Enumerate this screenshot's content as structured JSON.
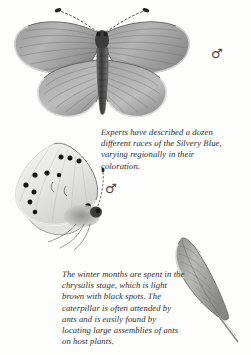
{
  "page": {
    "background_color": "#fdfdfb",
    "ink_color": "#2b2b2b",
    "width": 251,
    "height": 355
  },
  "captions": {
    "top": "Experts have described a dozen different races of the Silvery Blue, varying regionally in their coloration.",
    "bottom": "The winter months are spent in the chrysalis stage, which is light brown with black spots. The caterpillar is often attended by ants and is easily found by locating large assemblies of ants on host plants."
  },
  "symbols": {
    "dorsal_sex": "♂",
    "ventral_sex": "♂"
  },
  "illustrations": [
    {
      "name": "butterfly-dorsal",
      "description": "Silvery Blue butterfly, wings spread, dorsal view, grayscale engraving",
      "sex": "male"
    },
    {
      "name": "butterfly-ventral",
      "description": "Silvery Blue butterfly, wings folded, ventral view with black spots, grayscale engraving",
      "sex": "male"
    },
    {
      "name": "chrysalis",
      "description": "Elongated chrysalis attached to a stem, grayscale engraving"
    }
  ]
}
